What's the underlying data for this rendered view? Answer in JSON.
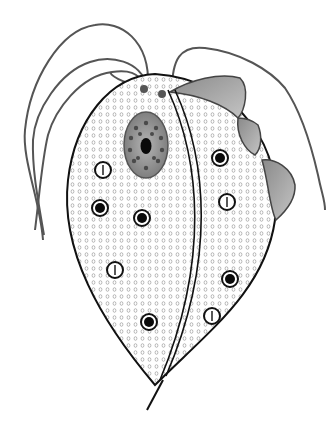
{
  "diagram": {
    "labels": [],
    "colors": {
      "background": "#ffffff",
      "outline": "#111111",
      "flagella": "#555555",
      "cytoplasm_dot": "#9a9a9a",
      "nucleus_fill": "#8c8c8c",
      "nucleus_granule": "#4a4a4a",
      "undulating_membrane": "#a0a0a0",
      "granule_core": "#0a0a0a",
      "vacuole_fill": "#ffffff"
    },
    "parts": {
      "anterior_flagella_count": 4,
      "recurrent_flagellum": 1,
      "nucleus": {
        "cx": 146,
        "cy": 145,
        "rx": 22,
        "ry": 33
      },
      "dark_granules": [
        {
          "cx": 220,
          "cy": 158
        },
        {
          "cx": 100,
          "cy": 208
        },
        {
          "cx": 142,
          "cy": 218
        },
        {
          "cx": 230,
          "cy": 279
        },
        {
          "cx": 149,
          "cy": 322
        }
      ],
      "light_vacuoles": [
        {
          "cx": 103,
          "cy": 170
        },
        {
          "cx": 227,
          "cy": 202
        },
        {
          "cx": 115,
          "cy": 270
        },
        {
          "cx": 212,
          "cy": 316
        }
      ]
    }
  }
}
